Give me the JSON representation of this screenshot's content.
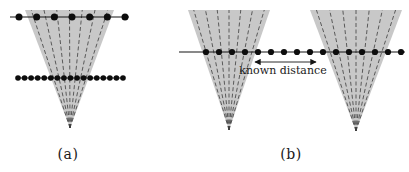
{
  "figure": {
    "colors": {
      "background": "#ffffff",
      "cone_fill": "#c8c8c8",
      "ray": "#3c3c3c",
      "line": "#151515",
      "dot": "#0d0d0d",
      "text": "#1a1a1a"
    },
    "panels": [
      {
        "id": "a",
        "label": "(a)",
        "label_pos": {
          "x": 68,
          "y": 146
        },
        "cones": [
          {
            "apex": {
              "x": 70,
              "y": 128
            },
            "top_y": 10,
            "top_x1": 25,
            "top_x2": 114,
            "num_rays": 7
          }
        ],
        "dot_rows": [
          {
            "y": 17,
            "line_x1": 10,
            "line_x2": 129,
            "dots_start": 19,
            "dots_end": 125,
            "num_dots": 7,
            "dot_radius": 3.5
          },
          {
            "y": 78,
            "line_x1": 16,
            "line_x2": 124,
            "dots_start": 18,
            "dots_end": 123,
            "num_dots": 17,
            "dot_radius": 2.8
          }
        ]
      },
      {
        "id": "b",
        "label": "(b)",
        "label_pos": {
          "x": 291,
          "y": 146
        },
        "cones": [
          {
            "apex": {
              "x": 229,
              "y": 130
            },
            "top_y": 10,
            "top_x1": 188,
            "top_x2": 270,
            "num_rays": 7
          },
          {
            "apex": {
              "x": 356,
              "y": 131
            },
            "top_y": 10,
            "top_x1": 310,
            "top_x2": 402,
            "num_rays": 7
          }
        ],
        "dot_rows": [
          {
            "y": 52,
            "line_x1": 179,
            "line_x2": 405,
            "dots_start": 206,
            "dots_end": 401,
            "num_dots": 16,
            "dot_radius": 3.1
          }
        ],
        "annotation": {
          "text": "known distance",
          "text_pos": {
            "x": 283,
            "y": 64
          },
          "arrow": {
            "x1": 251,
            "x2": 320,
            "y": 62
          }
        }
      }
    ]
  }
}
